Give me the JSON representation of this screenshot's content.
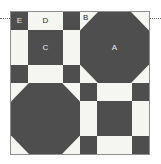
{
  "figure": {
    "kind": "quilt-block-diagram",
    "title": "",
    "width_px": 161,
    "height_px": 164
  },
  "colors": {
    "dark_fabric": "#4e4e4e",
    "light_fabric": "#f5f5f2",
    "frame_border": "#8e8e8e",
    "guide_line": "#6d6d6d",
    "label_on_dark": "#eceae5",
    "label_on_light": "#2e2e2e",
    "background": "#ffffff"
  },
  "guides": {
    "left": "dotted-guide-line",
    "right": "dotted-guide-line"
  },
  "block": {
    "name": "quilt-block",
    "quadrants": [
      {
        "position": "top-left",
        "type": "nine-patch",
        "ratio": "1:2:1",
        "cells": [
          {
            "name": "E",
            "fill": "dark"
          },
          {
            "name": "D",
            "fill": "light"
          },
          {
            "name": "",
            "fill": "dark"
          },
          {
            "name": "",
            "fill": "light"
          },
          {
            "name": "C",
            "fill": "dark"
          },
          {
            "name": "",
            "fill": "light"
          },
          {
            "name": "",
            "fill": "dark"
          },
          {
            "name": "",
            "fill": "light"
          },
          {
            "name": "",
            "fill": "dark"
          }
        ]
      },
      {
        "position": "top-right",
        "type": "snowball",
        "octagon_fill": "dark",
        "corner_fill": "light",
        "labels": [
          {
            "name": "A",
            "on": "dark"
          },
          {
            "name": "B",
            "on": "light"
          }
        ]
      },
      {
        "position": "bottom-left",
        "type": "snowball",
        "octagon_fill": "dark",
        "corner_fill": "light",
        "labels": []
      },
      {
        "position": "bottom-right",
        "type": "nine-patch",
        "ratio": "1:2:1",
        "cells": [
          {
            "name": "",
            "fill": "dark"
          },
          {
            "name": "",
            "fill": "light"
          },
          {
            "name": "",
            "fill": "dark"
          },
          {
            "name": "",
            "fill": "light"
          },
          {
            "name": "",
            "fill": "dark"
          },
          {
            "name": "",
            "fill": "light"
          },
          {
            "name": "",
            "fill": "dark"
          },
          {
            "name": "",
            "fill": "light"
          },
          {
            "name": "",
            "fill": "dark"
          }
        ]
      }
    ]
  },
  "labels": {
    "A": "A",
    "B": "B",
    "C": "C",
    "D": "D",
    "E": "E"
  }
}
